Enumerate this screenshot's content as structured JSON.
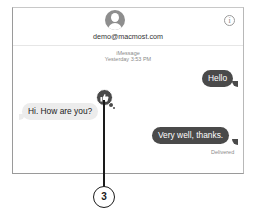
{
  "header": {
    "contact": "demo@macmost.com",
    "avatar_icon": "person-silhouette-icon",
    "info_icon": "info-icon",
    "info_glyph": "i"
  },
  "thread": {
    "service": "iMessage",
    "timestamp": "Yesterday 3:53 PM"
  },
  "messages": [
    {
      "direction": "outgoing",
      "text": "Hello"
    },
    {
      "direction": "incoming",
      "text": "Hi. How are you?",
      "tapback": "thumbs-up"
    },
    {
      "direction": "outgoing",
      "text": "Very well, thanks.",
      "status": "Delivered"
    }
  ],
  "callout": {
    "number": "3"
  },
  "colors": {
    "outgoing_bubble": "#4a4a4a",
    "incoming_bubble": "#ececec",
    "meta_text": "#8a8a8a"
  }
}
